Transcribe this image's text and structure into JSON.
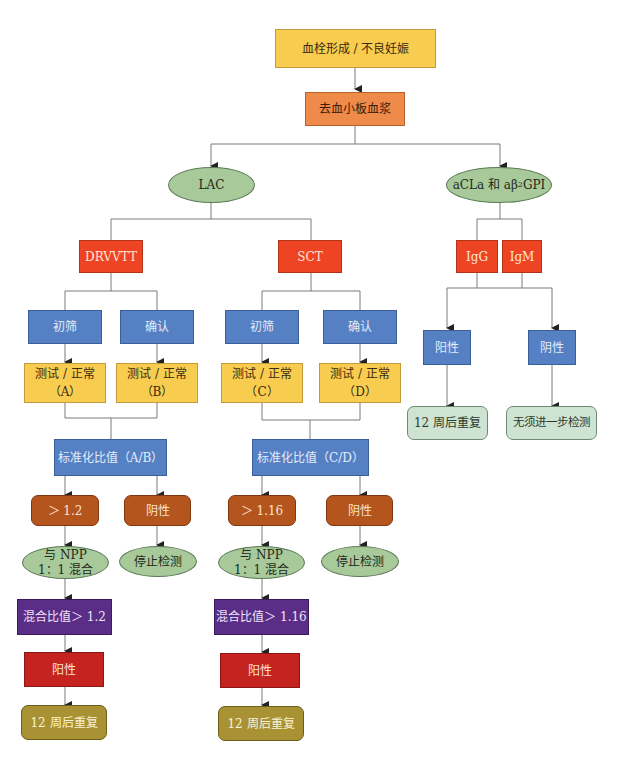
{
  "colors": {
    "start": "#f8cd4f",
    "plasma": "#ee8a4a",
    "ellipse": "#a8c99a",
    "assay": "#ef4423",
    "step": "#5580c4",
    "test": "#f8cd4f",
    "ratio": "#5580c4",
    "result": "#b4551e",
    "mix_ratio": "#5a2d86",
    "positive": "#c4231f",
    "repeat": "#a99234",
    "outcome": "#cfe3d2",
    "line": "#777777"
  },
  "nodes": {
    "start": "血栓形成 / 不良妊娠",
    "plasma": "去血小板血浆",
    "lac": "LAC",
    "acl": {
      "prefix": "aCLa 和 aβ",
      "sub": "2",
      "suffix": "GPI"
    },
    "drvvt": "DRVVTT",
    "sct": "SCT",
    "igg": "IgG",
    "igm": "IgM",
    "left": {
      "screen": "初筛",
      "confirm": "确认",
      "test_a_line1": "测试 / 正常",
      "test_a_line2": "（A）",
      "test_b_line1": "测试 / 正常",
      "test_b_line2": "（B）",
      "ratio": "标准化比值（A/B）",
      "gt": "＞ 1.2",
      "neg": "阴性",
      "mix_line1": "与 NPP",
      "mix_line2": "1：1 混合",
      "stop": "停止检测",
      "mix_ratio": "混合比值＞ 1.2",
      "positive": "阳性",
      "repeat": "12 周后重复"
    },
    "mid": {
      "screen": "初筛",
      "confirm": "确认",
      "test_c_line1": "测试 / 正常",
      "test_c_line2": "（C）",
      "test_d_line1": "测试 / 正常",
      "test_d_line2": "（D）",
      "ratio": "标准化比值（C/D）",
      "gt": "＞ 1.16",
      "neg": "阴性",
      "mix_line1": "与 NPP",
      "mix_line2": "1：1 混合",
      "stop": "停止检测",
      "mix_ratio": "混合比值＞ 1.16",
      "positive": "阳性",
      "repeat": "12 周后重复"
    },
    "right": {
      "positive": "阳性",
      "negative": "阴性",
      "repeat": "12 周后重复",
      "no_further": "无须进一步检测"
    }
  }
}
